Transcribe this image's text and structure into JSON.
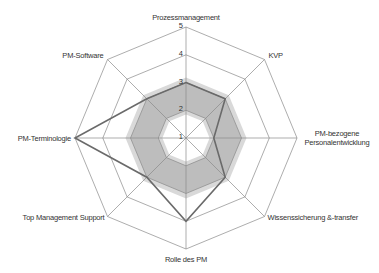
{
  "chart_data": {
    "type": "radar",
    "title": "",
    "categories": [
      "Prozessmanagement",
      "KVP",
      "PM-bezogene Personalentwicklung",
      "Wissenssicherung &-transfer",
      "Rolle des PM",
      "Top Management Support",
      "PM-Terminologie",
      "PM-Software"
    ],
    "category_label_lines": [
      [
        "Prozessmanagement"
      ],
      [
        "KVP"
      ],
      [
        "PM-bezogene",
        "Personalentwicklung"
      ],
      [
        "Wissenssicherung &-transfer"
      ],
      [
        "Rolle des PM"
      ],
      [
        "Top Management Support"
      ],
      [
        "PM-Terminologie"
      ],
      [
        "PM-Software"
      ]
    ],
    "series": [
      {
        "name": "Profil",
        "values": [
          3,
          3,
          2,
          3,
          4,
          3,
          5,
          3
        ],
        "color": "#666666",
        "style": "line"
      },
      {
        "name": "Bandbreite",
        "lower": [
          2,
          2,
          2,
          2,
          2,
          2,
          2,
          2
        ],
        "upper": [
          3,
          3,
          3,
          3,
          3,
          3,
          3,
          3
        ],
        "color": "#c8c8c8",
        "style": "band"
      }
    ],
    "scale": {
      "min": 1,
      "max": 5,
      "ticks": [
        1,
        2,
        3,
        4,
        5
      ]
    },
    "grid": true,
    "legend": "none"
  },
  "colors": {
    "grid": "#8a8a8a",
    "data_line": "#6a6a6a",
    "band_outer": "#d9d9d9",
    "band_inner": "#bdbdbd",
    "text": "#333333"
  }
}
